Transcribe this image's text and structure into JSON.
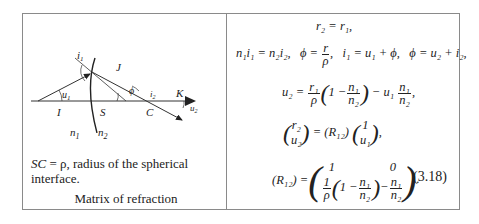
{
  "figure": {
    "labels": {
      "I": "I",
      "S": "S",
      "C": "C",
      "J": "J",
      "K": "K",
      "u1": "u",
      "u1_sub": "1",
      "u2": "u",
      "u2_sub": "2",
      "i1": "i",
      "i1_sub": "1",
      "i2": "i",
      "i2_sub": "2",
      "phi": "ϕ",
      "n1": "n",
      "n1_sub": "1",
      "n2": "n",
      "n2_sub": "2"
    },
    "caption": {
      "line1_italic": "SC",
      "line1_rest": " = ρ, radius of the spherical interface.",
      "title": "Matrix of refraction"
    }
  },
  "equations": {
    "eq1": "r₂ = r₁,",
    "eq2_a": "n₁i₁ = n₂i₂,",
    "eq2_phi": "ϕ =",
    "eq2_num": "r",
    "eq2_den": "ρ",
    "eq2_b": ",   i₁ = u₁ + ϕ,   ϕ = u₂ + i₂,",
    "eq3_lhs": "u₂ =",
    "eq3_num1": "r₁",
    "eq3_den1": "ρ",
    "eq3_one": "1 −",
    "eq3_num2": "n₁",
    "eq3_den2": "n₂",
    "eq3_mid": "− u₁",
    "eq3_num3": "n₁",
    "eq3_den3": "n₂",
    "eq3_end": ",",
    "eq4_v1_top": "r₂",
    "eq4_v1_bot": "u₂",
    "eq4_mid": "= (R₁₂)",
    "eq4_v2_top": "1",
    "eq4_v2_bot": "u₁",
    "eq4_end": ",",
    "eq5_lhs": "(R₁₂) =",
    "eq5_r1c1": "1",
    "eq5_r1c2": "0",
    "eq5_r2_num": "1",
    "eq5_r2_den": "ρ",
    "eq5_r2_one": "1 −",
    "eq5_r2_n": "n₁",
    "eq5_r2_d": "n₂",
    "eq5_r2c2_minus": "−",
    "eq5_r2c2_n": "n₁",
    "eq5_r2c2_d": "n₂",
    "eq5_end": ".",
    "number": "(3.18)"
  }
}
